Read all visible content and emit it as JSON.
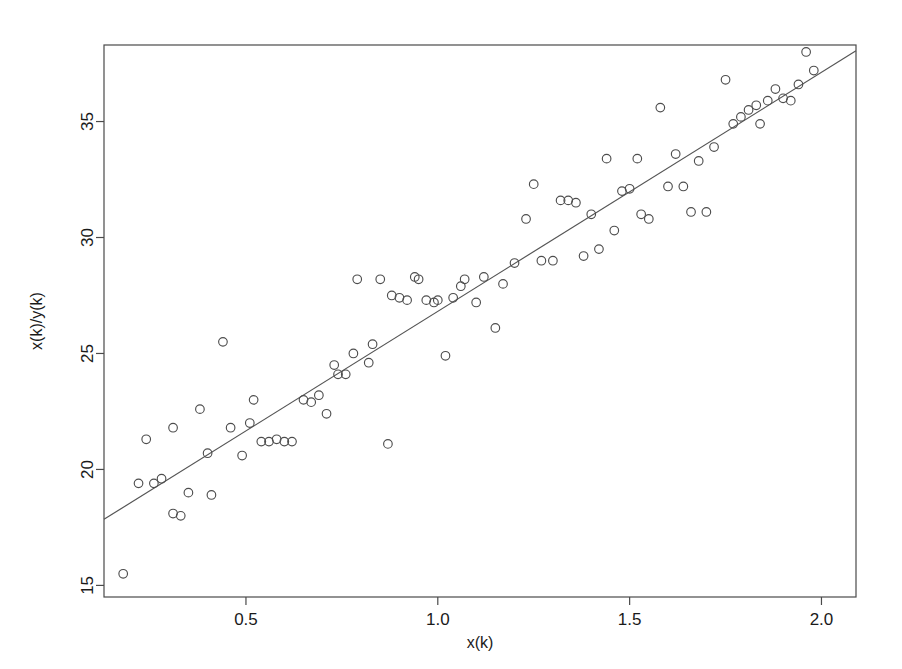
{
  "chart_data": {
    "type": "scatter",
    "title": "",
    "xlabel": "x(k)",
    "ylabel": "x(k)/y(k)",
    "xlim": [
      0.13,
      2.09
    ],
    "ylim": [
      14.5,
      38.3
    ],
    "xticks": [
      0.5,
      1.0,
      1.5,
      2.0
    ],
    "xticklabels": [
      "0.5",
      "1.0",
      "1.5",
      "2.0"
    ],
    "yticks": [
      15,
      20,
      25,
      30,
      35
    ],
    "yticklabels": [
      "15",
      "20",
      "25",
      "30",
      "35"
    ],
    "grid": false,
    "legend": null,
    "marker": "open-circle",
    "point_color": "#4d4d4d",
    "line_color": "#555555",
    "frame_color": "#4a4a4a",
    "background": "#ffffff",
    "fit_line": {
      "label": "least-squares fit",
      "x": [
        0.13,
        2.09
      ],
      "y": [
        17.85,
        38.05
      ],
      "slope": 10.3,
      "intercept": 16.5
    },
    "points": [
      [
        0.18,
        15.5
      ],
      [
        0.22,
        19.4
      ],
      [
        0.24,
        21.3
      ],
      [
        0.26,
        19.4
      ],
      [
        0.28,
        19.6
      ],
      [
        0.31,
        21.8
      ],
      [
        0.31,
        18.1
      ],
      [
        0.33,
        18.0
      ],
      [
        0.35,
        19.0
      ],
      [
        0.38,
        22.6
      ],
      [
        0.4,
        20.7
      ],
      [
        0.41,
        18.9
      ],
      [
        0.44,
        25.5
      ],
      [
        0.46,
        21.8
      ],
      [
        0.49,
        20.6
      ],
      [
        0.51,
        22.0
      ],
      [
        0.52,
        23.0
      ],
      [
        0.54,
        21.2
      ],
      [
        0.56,
        21.2
      ],
      [
        0.58,
        21.3
      ],
      [
        0.6,
        21.2
      ],
      [
        0.62,
        21.2
      ],
      [
        0.65,
        23.0
      ],
      [
        0.67,
        22.9
      ],
      [
        0.69,
        23.2
      ],
      [
        0.71,
        22.4
      ],
      [
        0.73,
        24.5
      ],
      [
        0.74,
        24.1
      ],
      [
        0.76,
        24.1
      ],
      [
        0.78,
        25.0
      ],
      [
        0.79,
        28.2
      ],
      [
        0.82,
        24.6
      ],
      [
        0.83,
        25.4
      ],
      [
        0.85,
        28.2
      ],
      [
        0.87,
        21.1
      ],
      [
        0.88,
        27.5
      ],
      [
        0.9,
        27.4
      ],
      [
        0.92,
        27.3
      ],
      [
        0.94,
        28.3
      ],
      [
        0.95,
        28.2
      ],
      [
        0.97,
        27.3
      ],
      [
        0.99,
        27.2
      ],
      [
        1.0,
        27.3
      ],
      [
        1.02,
        24.9
      ],
      [
        1.04,
        27.4
      ],
      [
        1.06,
        27.9
      ],
      [
        1.07,
        28.2
      ],
      [
        1.1,
        27.2
      ],
      [
        1.12,
        28.3
      ],
      [
        1.15,
        26.1
      ],
      [
        1.17,
        28.0
      ],
      [
        1.2,
        28.9
      ],
      [
        1.23,
        30.8
      ],
      [
        1.25,
        32.3
      ],
      [
        1.27,
        29.0
      ],
      [
        1.3,
        29.0
      ],
      [
        1.32,
        31.6
      ],
      [
        1.34,
        31.6
      ],
      [
        1.36,
        31.5
      ],
      [
        1.38,
        29.2
      ],
      [
        1.4,
        31.0
      ],
      [
        1.42,
        29.5
      ],
      [
        1.44,
        33.4
      ],
      [
        1.46,
        30.3
      ],
      [
        1.48,
        32.0
      ],
      [
        1.5,
        32.1
      ],
      [
        1.52,
        33.4
      ],
      [
        1.53,
        31.0
      ],
      [
        1.55,
        30.8
      ],
      [
        1.58,
        35.6
      ],
      [
        1.6,
        32.2
      ],
      [
        1.62,
        33.6
      ],
      [
        1.64,
        32.2
      ],
      [
        1.66,
        31.1
      ],
      [
        1.68,
        33.3
      ],
      [
        1.7,
        31.1
      ],
      [
        1.72,
        33.9
      ],
      [
        1.75,
        36.8
      ],
      [
        1.77,
        34.9
      ],
      [
        1.79,
        35.2
      ],
      [
        1.81,
        35.5
      ],
      [
        1.83,
        35.7
      ],
      [
        1.84,
        34.9
      ],
      [
        1.86,
        35.9
      ],
      [
        1.88,
        36.4
      ],
      [
        1.9,
        36.0
      ],
      [
        1.92,
        35.9
      ],
      [
        1.94,
        36.6
      ],
      [
        1.96,
        38.0
      ],
      [
        1.98,
        37.2
      ]
    ]
  }
}
